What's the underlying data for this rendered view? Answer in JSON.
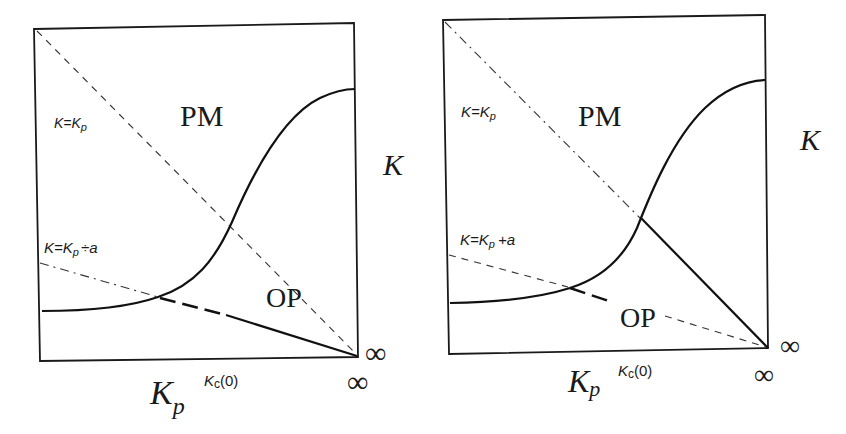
{
  "panels": [
    {
      "id": "left",
      "region_upper": "PM",
      "region_lower": "OP",
      "line1_label": "K=K",
      "line1_sub": "p",
      "line2_label": "K=K",
      "line2_sub": "p",
      "line2_suffix": "÷a",
      "axis_y_label": "K",
      "axis_x_label": "K",
      "axis_x_sub": "p",
      "tick_label": "K",
      "tick_sub": "c",
      "tick_suffix": "(0)",
      "inf_right": "∞",
      "inf_bottom": "∞",
      "line1_style": "dashed",
      "line2_style": "dash-dot"
    },
    {
      "id": "right",
      "region_upper": "PM",
      "region_lower": "OP",
      "line1_label": "K=K",
      "line1_sub": "p",
      "line2_label": "K=K",
      "line2_sub": "p",
      "line2_suffix": "+a",
      "axis_y_label": "K",
      "axis_x_label": "K",
      "axis_x_sub": "p",
      "tick_label": "K",
      "tick_sub": "c",
      "tick_suffix": "(0)",
      "inf_right": "∞",
      "inf_bottom": "∞",
      "line1_style": "dash-dot",
      "line2_style": "dashed"
    }
  ]
}
